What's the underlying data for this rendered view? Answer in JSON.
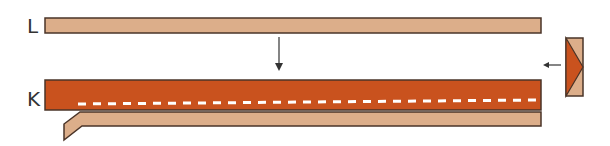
{
  "labels": {
    "top": "L",
    "bottom": "K"
  },
  "colors": {
    "tan": "#dcae8a",
    "rust": "#c9521e",
    "outline": "#4a3428",
    "dash": "#ffffff",
    "arrow": "#333333"
  }
}
